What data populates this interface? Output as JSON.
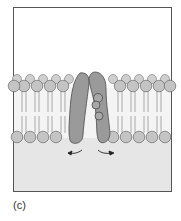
{
  "figure": {
    "panel_label": "(c)",
    "icons": [
      "phospholipid-head-icon",
      "channel-protein-icon",
      "arrow-left-icon",
      "arrow-right-icon"
    ],
    "colors": {
      "frame_border": "#555555",
      "extracellular": "#ffffff",
      "cytoplasm": "#e6e6e6",
      "lipid_head": "#c4c4c4",
      "lipid_head_stroke": "#6a6a6a",
      "protein": "#9a9a9a",
      "protein_stroke": "#4a4a4a",
      "tails": "#777777",
      "arrow": "#222222"
    }
  }
}
